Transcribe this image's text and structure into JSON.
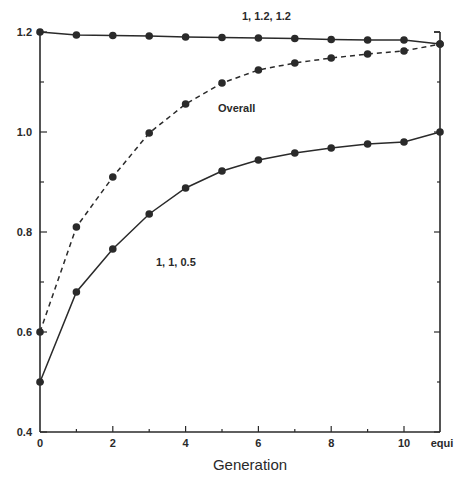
{
  "chart_data": {
    "type": "line",
    "title": "",
    "xlabel": "Generation",
    "ylabel": "",
    "x": [
      0,
      1,
      2,
      3,
      4,
      5,
      6,
      7,
      8,
      9,
      10,
      "equi"
    ],
    "x_tick_labels": [
      "0",
      "2",
      "4",
      "6",
      "8",
      "10",
      "equi"
    ],
    "y_tick_labels": [
      "0.4",
      "0.6",
      "0.8",
      "1.0",
      "1.2"
    ],
    "ylim": [
      0.4,
      1.2
    ],
    "grid": false,
    "legend": "inline labels",
    "series": [
      {
        "name": "1, 1.2, 1.2",
        "style": "solid",
        "values": [
          1.2,
          1.194,
          1.193,
          1.192,
          1.19,
          1.189,
          1.188,
          1.187,
          1.185,
          1.184,
          1.184,
          1.176
        ]
      },
      {
        "name": "Overall",
        "style": "dashed",
        "values": [
          0.6,
          0.81,
          0.91,
          0.998,
          1.056,
          1.098,
          1.124,
          1.138,
          1.148,
          1.156,
          1.162,
          1.176
        ]
      },
      {
        "name": "1, 1, 0.5",
        "style": "solid",
        "values": [
          0.5,
          0.68,
          0.766,
          0.836,
          0.888,
          0.922,
          0.944,
          0.958,
          0.968,
          0.976,
          0.98,
          1.0
        ]
      }
    ],
    "annotations": [
      "1, 1.2, 1.2",
      "Overall",
      "1, 1, 0.5"
    ]
  }
}
